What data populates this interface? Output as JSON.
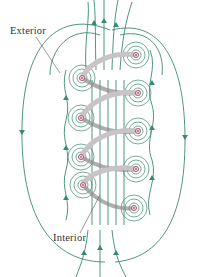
{
  "figure": {
    "labels": {
      "exterior": "Exterior",
      "interior": "Interior"
    },
    "colors": {
      "field_line": "#3a8a72",
      "coil": "#c9c3c7",
      "coil_shadow": "#8c8c8c",
      "conductor": "#b0526e",
      "leader_line": "#555555",
      "label_text": "#333333"
    },
    "conductors_out_of_page_right": [
      [
        136,
        55
      ],
      [
        138,
        93
      ],
      [
        138,
        131
      ],
      [
        136,
        169
      ],
      [
        134,
        208
      ]
    ],
    "conductors_into_page_left": [
      [
        82,
        78
      ],
      [
        81,
        118
      ],
      [
        81,
        157
      ],
      [
        83,
        185
      ]
    ]
  }
}
